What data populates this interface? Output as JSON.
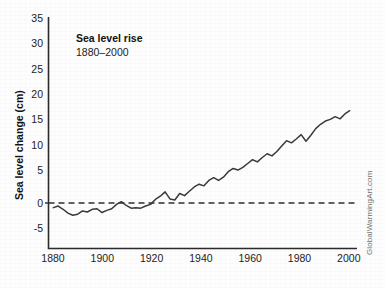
{
  "title": "Sea level rise",
  "subtitle": "1880–2000",
  "watermark": "GlobalWarmingArt.com",
  "axes": {
    "ylabel": "Sea level change (cm)",
    "xlabel": "",
    "y_ticks": [
      "35",
      "30",
      "25",
      "20",
      "15",
      "10",
      "5",
      "0",
      "-5"
    ],
    "x_ticks": [
      "1880",
      "1900",
      "1920",
      "1940",
      "1960",
      "1980",
      "2000"
    ]
  },
  "colors": {
    "line": "#3a3a3a",
    "axis": "#2b2b2b",
    "zero_line": "#2f2f2f",
    "background": "#fdfdfd",
    "text": "#1a1a1a",
    "watermark": "#6e6e6e"
  },
  "chart_data": {
    "type": "line",
    "title": "Sea level rise",
    "subtitle": "1880–2000",
    "xlabel": "",
    "ylabel": "Sea level change (cm)",
    "xlim": [
      1878,
      2005
    ],
    "ylim": [
      -7.5,
      35
    ],
    "grid": false,
    "legend": null,
    "annotations": [
      {
        "text": "Sea level rise",
        "x": 1890,
        "y": 30,
        "bold": true
      },
      {
        "text": "1880–2000",
        "x": 1890,
        "y": 27.5,
        "bold": false
      }
    ],
    "reference_lines": [
      {
        "y": 0,
        "style": "dashed",
        "label": ""
      }
    ],
    "x": [
      1880,
      1882,
      1884,
      1886,
      1888,
      1890,
      1892,
      1894,
      1896,
      1898,
      1900,
      1902,
      1904,
      1906,
      1908,
      1910,
      1912,
      1914,
      1916,
      1918,
      1920,
      1922,
      1924,
      1926,
      1928,
      1930,
      1932,
      1934,
      1936,
      1938,
      1940,
      1942,
      1944,
      1946,
      1948,
      1950,
      1952,
      1954,
      1956,
      1958,
      1960,
      1962,
      1964,
      1966,
      1968,
      1970,
      1972,
      1974,
      1976,
      1978,
      1980,
      1982,
      1984,
      1986,
      1988,
      1990,
      1992,
      1994,
      1996,
      1998,
      2000,
      2002
    ],
    "values": [
      0.0,
      0.3,
      -0.3,
      -1.0,
      -1.4,
      -1.2,
      -0.6,
      -0.8,
      -0.3,
      -0.2,
      -0.9,
      -0.5,
      -0.2,
      0.6,
      1.1,
      0.4,
      -0.1,
      0.0,
      -0.1,
      0.3,
      0.6,
      1.5,
      2.1,
      2.9,
      1.6,
      1.4,
      2.6,
      2.2,
      3.0,
      3.8,
      4.3,
      4.0,
      5.0,
      5.5,
      5.0,
      5.6,
      6.6,
      7.2,
      6.9,
      7.4,
      8.1,
      8.8,
      8.4,
      9.2,
      9.9,
      9.5,
      10.3,
      11.3,
      12.3,
      11.9,
      12.6,
      13.4,
      12.2,
      13.3,
      14.5,
      15.3,
      15.9,
      16.2,
      16.7,
      16.3,
      17.2,
      17.8
    ],
    "units": "cm",
    "series_name": "Global mean sea level change"
  }
}
